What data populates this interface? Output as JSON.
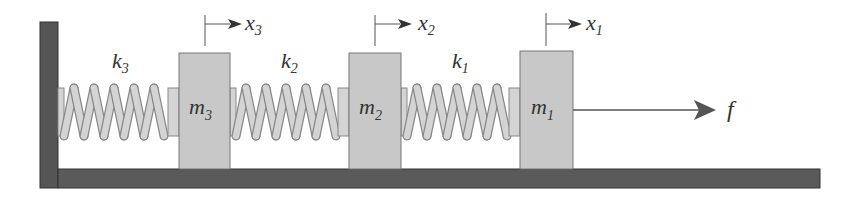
{
  "diagram": {
    "colors": {
      "wall": "#555555",
      "floor": "#555555",
      "mass_fill": "#c8c8c8",
      "mass_stroke": "#777777",
      "spring_fill": "#d4d4d4",
      "spring_stroke": "#888888",
      "arrow": "#555555",
      "text": "#333333"
    },
    "springs": [
      {
        "id": "k3",
        "label": "k",
        "sub": "3"
      },
      {
        "id": "k2",
        "label": "k",
        "sub": "2"
      },
      {
        "id": "k1",
        "label": "k",
        "sub": "1"
      }
    ],
    "masses": [
      {
        "id": "m3",
        "label": "m",
        "sub": "3",
        "disp_label": "x",
        "disp_sub": "3"
      },
      {
        "id": "m2",
        "label": "m",
        "sub": "2",
        "disp_label": "x",
        "disp_sub": "2"
      },
      {
        "id": "m1",
        "label": "m",
        "sub": "1",
        "disp_label": "x",
        "disp_sub": "1"
      }
    ],
    "force": {
      "label": "f"
    }
  }
}
